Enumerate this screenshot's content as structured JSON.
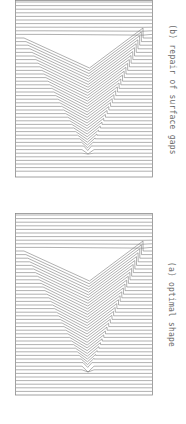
{
  "figure": {
    "panels": [
      {
        "id": "b",
        "caption": "(b) repair of surface gaps",
        "top": 0,
        "height": 178
      },
      {
        "id": "a",
        "caption": "(a) optimal shape",
        "top": 213,
        "height": 183
      }
    ],
    "style": {
      "line_color": "#7a7a7a",
      "frame_color": "#8a8a8a",
      "caption_color": "#6a6a6a"
    },
    "rendering": {
      "type": "wireframe_surface",
      "description": "Parallel horizontal lines (scanlines) across a rectangle, deflected into a V-shaped groove",
      "line_spacing_px": 3.6
    }
  }
}
